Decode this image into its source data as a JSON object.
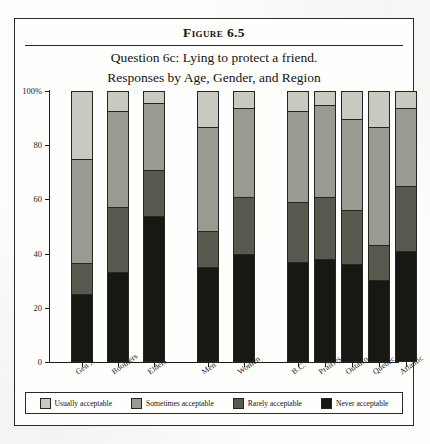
{
  "figure": {
    "number_label": "Figure 6.5",
    "subtitle_line1": "Question 6c: Lying to protect a friend.",
    "subtitle_line2": "Responses by Age, Gender, and Region"
  },
  "legend": {
    "items": [
      {
        "label": "Usually acceptable",
        "color": "#c9c9c2"
      },
      {
        "label": "Sometimes acceptable",
        "color": "#9a9a93"
      },
      {
        "label": "Rarely acceptable",
        "color": "#58584f"
      },
      {
        "label": "Never acceptable",
        "color": "#171714"
      }
    ]
  },
  "chart_data": {
    "type": "bar",
    "title": "Question 6c: Lying to protect a friend. Responses by Age, Gender, and Region",
    "xlabel": "",
    "ylabel": "",
    "ylim": [
      0,
      100
    ],
    "ytick_labels": [
      "0",
      "20",
      "40",
      "60",
      "80",
      "100%"
    ],
    "ytick_values": [
      0,
      20,
      40,
      60,
      80,
      100
    ],
    "stacked": true,
    "stack_order_bottom_to_top": [
      "Never acceptable",
      "Rarely acceptable",
      "Sometimes acceptable",
      "Usually acceptable"
    ],
    "grid": false,
    "legend_position": "bottom",
    "categories": [
      "Gen X",
      "Boomers",
      "Elders",
      "Men",
      "Women",
      "B.C.",
      "Prairies",
      "Ontario",
      "Quebec",
      "Atlantic"
    ],
    "category_groups": [
      {
        "name": "Age",
        "categories": [
          "Gen X",
          "Boomers",
          "Elders"
        ]
      },
      {
        "name": "Gender",
        "categories": [
          "Men",
          "Women"
        ]
      },
      {
        "name": "Region",
        "categories": [
          "B.C.",
          "Prairies",
          "Ontario",
          "Quebec",
          "Atlantic"
        ]
      }
    ],
    "series": [
      {
        "name": "Never acceptable",
        "color": "#171714",
        "values": [
          25,
          33,
          54,
          35,
          40,
          37,
          38,
          36,
          30,
          41
        ]
      },
      {
        "name": "Rarely acceptable",
        "color": "#58584f",
        "values": [
          11,
          24,
          17,
          13,
          21,
          22,
          23,
          20,
          13,
          24
        ]
      },
      {
        "name": "Sometimes acceptable",
        "color": "#9a9a93",
        "values": [
          39,
          36,
          25,
          39,
          33,
          34,
          34,
          34,
          44,
          29
        ]
      },
      {
        "name": "Usually acceptable",
        "color": "#c9c9c2",
        "values": [
          25,
          7,
          4,
          13,
          6,
          7,
          5,
          10,
          13,
          6
        ]
      }
    ]
  },
  "layout": {
    "bar_x_positions": [
      22,
      58,
      94,
      148,
      184,
      238,
      265,
      292,
      319,
      346
    ],
    "group_gap_note": "extra space separates Age / Gender / Region groups"
  }
}
